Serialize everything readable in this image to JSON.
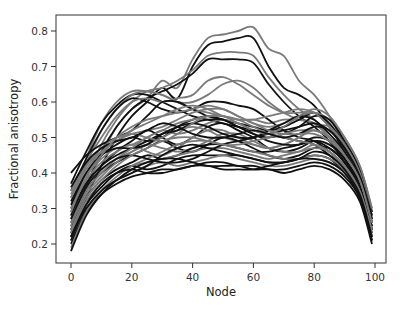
{
  "chart_data": {
    "type": "line",
    "title": "",
    "xlabel": "Node",
    "ylabel": "Fractional anisotropy",
    "xlim": [
      -5,
      103
    ],
    "ylim": [
      0.15,
      0.84
    ],
    "xticks": [
      0,
      20,
      40,
      60,
      80,
      100
    ],
    "yticks": [
      0.2,
      0.3,
      0.4,
      0.5,
      0.6,
      0.7,
      0.8
    ],
    "ytick_labels": [
      "0.2",
      "0.3",
      "0.4",
      "0.5",
      "0.6",
      "0.7",
      "0.8"
    ],
    "xtick_labels": [
      "0",
      "20",
      "40",
      "60",
      "80",
      "100"
    ],
    "grid": false,
    "legend": null,
    "line_colors": {
      "dark": "#111111",
      "light": "#7a7a7a"
    },
    "x": [
      0,
      5,
      10,
      15,
      20,
      25,
      30,
      35,
      40,
      45,
      50,
      55,
      60,
      65,
      70,
      75,
      80,
      85,
      90,
      95,
      99
    ],
    "series": [
      {
        "name": "tract-1",
        "color": "light",
        "values": [
          0.24,
          0.36,
          0.45,
          0.53,
          0.58,
          0.61,
          0.66,
          0.64,
          0.72,
          0.78,
          0.79,
          0.8,
          0.81,
          0.75,
          0.73,
          0.66,
          0.62,
          0.56,
          0.48,
          0.4,
          0.28
        ]
      },
      {
        "name": "tract-2",
        "color": "dark",
        "values": [
          0.22,
          0.33,
          0.42,
          0.5,
          0.56,
          0.6,
          0.64,
          0.61,
          0.7,
          0.76,
          0.77,
          0.78,
          0.78,
          0.7,
          0.64,
          0.62,
          0.59,
          0.53,
          0.46,
          0.38,
          0.26
        ]
      },
      {
        "name": "tract-3",
        "color": "light",
        "values": [
          0.25,
          0.38,
          0.48,
          0.55,
          0.6,
          0.63,
          0.64,
          0.66,
          0.69,
          0.73,
          0.74,
          0.74,
          0.73,
          0.67,
          0.62,
          0.58,
          0.55,
          0.5,
          0.44,
          0.37,
          0.24
        ]
      },
      {
        "name": "tract-4",
        "color": "dark",
        "values": [
          0.23,
          0.36,
          0.46,
          0.53,
          0.58,
          0.61,
          0.63,
          0.65,
          0.68,
          0.72,
          0.72,
          0.72,
          0.71,
          0.65,
          0.6,
          0.56,
          0.53,
          0.49,
          0.43,
          0.36,
          0.23
        ]
      },
      {
        "name": "tract-5",
        "color": "light",
        "values": [
          0.3,
          0.44,
          0.54,
          0.6,
          0.63,
          0.63,
          0.62,
          0.6,
          0.58,
          0.57,
          0.56,
          0.55,
          0.55,
          0.54,
          0.55,
          0.55,
          0.54,
          0.5,
          0.45,
          0.38,
          0.27
        ]
      },
      {
        "name": "tract-6",
        "color": "dark",
        "values": [
          0.37,
          0.46,
          0.54,
          0.59,
          0.62,
          0.62,
          0.6,
          0.58,
          0.56,
          0.55,
          0.54,
          0.53,
          0.52,
          0.51,
          0.5,
          0.49,
          0.48,
          0.45,
          0.41,
          0.35,
          0.25
        ]
      },
      {
        "name": "tract-7",
        "color": "light",
        "values": [
          0.28,
          0.42,
          0.52,
          0.58,
          0.62,
          0.63,
          0.62,
          0.6,
          0.6,
          0.62,
          0.65,
          0.66,
          0.64,
          0.6,
          0.57,
          0.55,
          0.54,
          0.5,
          0.44,
          0.37,
          0.26
        ]
      },
      {
        "name": "tract-8",
        "color": "dark",
        "values": [
          0.35,
          0.44,
          0.52,
          0.58,
          0.61,
          0.6,
          0.58,
          0.57,
          0.58,
          0.6,
          0.6,
          0.59,
          0.58,
          0.55,
          0.52,
          0.5,
          0.49,
          0.46,
          0.42,
          0.36,
          0.25
        ]
      },
      {
        "name": "tract-9",
        "color": "light",
        "values": [
          0.33,
          0.43,
          0.5,
          0.56,
          0.6,
          0.61,
          0.6,
          0.61,
          0.62,
          0.66,
          0.67,
          0.65,
          0.62,
          0.59,
          0.57,
          0.57,
          0.57,
          0.53,
          0.47,
          0.39,
          0.28
        ]
      },
      {
        "name": "tract-10",
        "color": "dark",
        "values": [
          0.4,
          0.45,
          0.48,
          0.5,
          0.52,
          0.56,
          0.6,
          0.6,
          0.58,
          0.56,
          0.55,
          0.54,
          0.53,
          0.52,
          0.53,
          0.55,
          0.57,
          0.54,
          0.48,
          0.4,
          0.29
        ]
      },
      {
        "name": "tract-11",
        "color": "light",
        "values": [
          0.35,
          0.42,
          0.46,
          0.49,
          0.51,
          0.52,
          0.53,
          0.55,
          0.57,
          0.58,
          0.58,
          0.56,
          0.54,
          0.53,
          0.54,
          0.56,
          0.57,
          0.55,
          0.5,
          0.42,
          0.3
        ]
      },
      {
        "name": "tract-12",
        "color": "dark",
        "values": [
          0.32,
          0.4,
          0.45,
          0.48,
          0.5,
          0.49,
          0.5,
          0.53,
          0.55,
          0.56,
          0.55,
          0.53,
          0.51,
          0.5,
          0.51,
          0.53,
          0.56,
          0.55,
          0.49,
          0.41,
          0.29
        ]
      },
      {
        "name": "tract-13",
        "color": "light",
        "values": [
          0.3,
          0.39,
          0.44,
          0.47,
          0.48,
          0.5,
          0.52,
          0.51,
          0.52,
          0.54,
          0.55,
          0.54,
          0.52,
          0.51,
          0.5,
          0.51,
          0.52,
          0.5,
          0.46,
          0.39,
          0.27
        ]
      },
      {
        "name": "tract-14",
        "color": "dark",
        "values": [
          0.28,
          0.37,
          0.42,
          0.46,
          0.49,
          0.52,
          0.5,
          0.48,
          0.5,
          0.53,
          0.54,
          0.52,
          0.5,
          0.47,
          0.46,
          0.47,
          0.49,
          0.48,
          0.44,
          0.37,
          0.26
        ]
      },
      {
        "name": "tract-15",
        "color": "light",
        "values": [
          0.27,
          0.36,
          0.41,
          0.44,
          0.46,
          0.48,
          0.5,
          0.52,
          0.53,
          0.52,
          0.5,
          0.49,
          0.48,
          0.47,
          0.48,
          0.5,
          0.52,
          0.5,
          0.45,
          0.38,
          0.26
        ]
      },
      {
        "name": "tract-16",
        "color": "dark",
        "values": [
          0.26,
          0.35,
          0.4,
          0.43,
          0.45,
          0.47,
          0.49,
          0.47,
          0.46,
          0.48,
          0.5,
          0.49,
          0.47,
          0.45,
          0.44,
          0.45,
          0.47,
          0.47,
          0.43,
          0.36,
          0.24
        ]
      },
      {
        "name": "tract-17",
        "color": "light",
        "values": [
          0.25,
          0.34,
          0.39,
          0.43,
          0.46,
          0.48,
          0.47,
          0.46,
          0.47,
          0.49,
          0.51,
          0.51,
          0.49,
          0.47,
          0.46,
          0.46,
          0.48,
          0.46,
          0.42,
          0.35,
          0.24
        ]
      },
      {
        "name": "tract-18",
        "color": "dark",
        "values": [
          0.24,
          0.33,
          0.38,
          0.41,
          0.43,
          0.45,
          0.44,
          0.45,
          0.47,
          0.48,
          0.48,
          0.47,
          0.46,
          0.46,
          0.47,
          0.48,
          0.5,
          0.49,
          0.44,
          0.36,
          0.24
        ]
      },
      {
        "name": "tract-19",
        "color": "light",
        "values": [
          0.23,
          0.32,
          0.37,
          0.4,
          0.42,
          0.43,
          0.44,
          0.45,
          0.46,
          0.47,
          0.47,
          0.46,
          0.45,
          0.44,
          0.45,
          0.46,
          0.47,
          0.46,
          0.42,
          0.35,
          0.23
        ]
      },
      {
        "name": "tract-20",
        "color": "dark",
        "values": [
          0.22,
          0.31,
          0.36,
          0.4,
          0.42,
          0.41,
          0.42,
          0.44,
          0.45,
          0.45,
          0.45,
          0.45,
          0.44,
          0.43,
          0.43,
          0.44,
          0.45,
          0.44,
          0.4,
          0.34,
          0.22
        ]
      },
      {
        "name": "tract-21",
        "color": "light",
        "values": [
          0.21,
          0.3,
          0.35,
          0.38,
          0.4,
          0.42,
          0.43,
          0.42,
          0.43,
          0.44,
          0.45,
          0.44,
          0.43,
          0.42,
          0.42,
          0.43,
          0.44,
          0.43,
          0.4,
          0.33,
          0.22
        ]
      },
      {
        "name": "tract-22",
        "color": "dark",
        "values": [
          0.2,
          0.29,
          0.34,
          0.37,
          0.39,
          0.4,
          0.41,
          0.41,
          0.42,
          0.43,
          0.43,
          0.42,
          0.42,
          0.41,
          0.41,
          0.42,
          0.43,
          0.42,
          0.39,
          0.33,
          0.21
        ]
      },
      {
        "name": "tract-23",
        "color": "light",
        "values": [
          0.19,
          0.29,
          0.35,
          0.39,
          0.42,
          0.44,
          0.46,
          0.48,
          0.49,
          0.49,
          0.48,
          0.47,
          0.46,
          0.45,
          0.44,
          0.44,
          0.45,
          0.44,
          0.41,
          0.34,
          0.22
        ]
      },
      {
        "name": "tract-24",
        "color": "dark",
        "values": [
          0.18,
          0.28,
          0.34,
          0.38,
          0.41,
          0.43,
          0.44,
          0.44,
          0.43,
          0.42,
          0.42,
          0.42,
          0.41,
          0.41,
          0.4,
          0.41,
          0.42,
          0.41,
          0.38,
          0.32,
          0.2
        ]
      },
      {
        "name": "tract-25",
        "color": "light",
        "values": [
          0.3,
          0.38,
          0.43,
          0.46,
          0.48,
          0.46,
          0.45,
          0.47,
          0.5,
          0.52,
          0.52,
          0.5,
          0.48,
          0.47,
          0.48,
          0.5,
          0.53,
          0.53,
          0.48,
          0.4,
          0.28
        ]
      },
      {
        "name": "tract-26",
        "color": "dark",
        "values": [
          0.31,
          0.4,
          0.45,
          0.47,
          0.47,
          0.48,
          0.51,
          0.53,
          0.54,
          0.53,
          0.51,
          0.5,
          0.5,
          0.52,
          0.54,
          0.56,
          0.55,
          0.51,
          0.46,
          0.38,
          0.27
        ]
      },
      {
        "name": "tract-27",
        "color": "light",
        "values": [
          0.33,
          0.41,
          0.46,
          0.49,
          0.52,
          0.54,
          0.56,
          0.58,
          0.59,
          0.58,
          0.56,
          0.55,
          0.55,
          0.56,
          0.57,
          0.58,
          0.57,
          0.53,
          0.47,
          0.39,
          0.27
        ]
      },
      {
        "name": "tract-28",
        "color": "dark",
        "values": [
          0.29,
          0.37,
          0.42,
          0.45,
          0.47,
          0.49,
          0.51,
          0.52,
          0.54,
          0.55,
          0.55,
          0.53,
          0.51,
          0.49,
          0.48,
          0.48,
          0.49,
          0.47,
          0.43,
          0.36,
          0.25
        ]
      },
      {
        "name": "tract-29",
        "color": "light",
        "values": [
          0.26,
          0.35,
          0.4,
          0.44,
          0.47,
          0.5,
          0.52,
          0.54,
          0.55,
          0.56,
          0.56,
          0.55,
          0.53,
          0.51,
          0.5,
          0.49,
          0.48,
          0.46,
          0.42,
          0.35,
          0.24
        ]
      },
      {
        "name": "tract-30",
        "color": "dark",
        "values": [
          0.27,
          0.36,
          0.41,
          0.44,
          0.45,
          0.44,
          0.43,
          0.43,
          0.44,
          0.46,
          0.48,
          0.49,
          0.5,
          0.51,
          0.52,
          0.53,
          0.54,
          0.52,
          0.47,
          0.39,
          0.28
        ]
      },
      {
        "name": "tract-31",
        "color": "light",
        "values": [
          0.24,
          0.33,
          0.38,
          0.42,
          0.45,
          0.47,
          0.49,
          0.5,
          0.5,
          0.49,
          0.48,
          0.48,
          0.49,
          0.5,
          0.51,
          0.52,
          0.52,
          0.5,
          0.45,
          0.38,
          0.26
        ]
      },
      {
        "name": "tract-32",
        "color": "dark",
        "values": [
          0.22,
          0.3,
          0.35,
          0.38,
          0.4,
          0.42,
          0.45,
          0.47,
          0.48,
          0.47,
          0.46,
          0.45,
          0.44,
          0.43,
          0.43,
          0.44,
          0.46,
          0.45,
          0.41,
          0.34,
          0.22
        ]
      },
      {
        "name": "tract-33",
        "color": "light",
        "values": [
          0.34,
          0.42,
          0.47,
          0.5,
          0.51,
          0.5,
          0.49,
          0.51,
          0.54,
          0.56,
          0.56,
          0.54,
          0.52,
          0.51,
          0.53,
          0.56,
          0.58,
          0.56,
          0.5,
          0.42,
          0.3
        ]
      },
      {
        "name": "tract-34",
        "color": "dark",
        "values": [
          0.36,
          0.43,
          0.47,
          0.49,
          0.5,
          0.52,
          0.54,
          0.53,
          0.51,
          0.5,
          0.5,
          0.51,
          0.52,
          0.51,
          0.5,
          0.51,
          0.53,
          0.52,
          0.47,
          0.39,
          0.27
        ]
      },
      {
        "name": "tract-35",
        "color": "light",
        "values": [
          0.29,
          0.39,
          0.45,
          0.5,
          0.53,
          0.55,
          0.56,
          0.57,
          0.58,
          0.59,
          0.58,
          0.56,
          0.54,
          0.52,
          0.51,
          0.51,
          0.51,
          0.49,
          0.45,
          0.38,
          0.26
        ]
      },
      {
        "name": "tract-36",
        "color": "dark",
        "values": [
          0.21,
          0.31,
          0.37,
          0.4,
          0.41,
          0.4,
          0.4,
          0.41,
          0.42,
          0.42,
          0.41,
          0.41,
          0.41,
          0.42,
          0.43,
          0.44,
          0.44,
          0.43,
          0.4,
          0.33,
          0.21
        ]
      }
    ]
  },
  "caption_fragment": "",
  "layout": {
    "plot_left": 56,
    "plot_top": 15,
    "plot_right": 386,
    "plot_bottom": 263,
    "x0_px": 71,
    "x100_px": 375,
    "y02_px": 244,
    "y08_px": 31
  }
}
